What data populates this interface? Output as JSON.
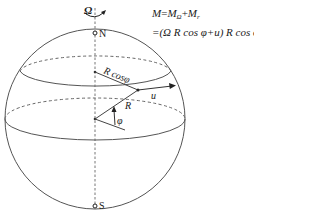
{
  "diagram": {
    "type": "rotating-earth-angular-momentum",
    "labels": {
      "rotation": "Ω",
      "north_pole": "N",
      "south_pole": "S",
      "radius_latitude": "R cosφ",
      "radius": "R",
      "velocity": "u",
      "latitude_angle": "φ"
    },
    "formula": {
      "line1_lhs": "M",
      "line1_eq": "=",
      "line1_t1": "M",
      "line1_t1_sub": "Ω",
      "line1_plus": "+",
      "line1_t2": "M",
      "line1_t2_sub": "r",
      "line2": "=(Ω R cos φ+u) R cos φ"
    },
    "colors": {
      "stroke": "#555555",
      "text": "#1a1a1a",
      "background": "#ffffff"
    }
  }
}
